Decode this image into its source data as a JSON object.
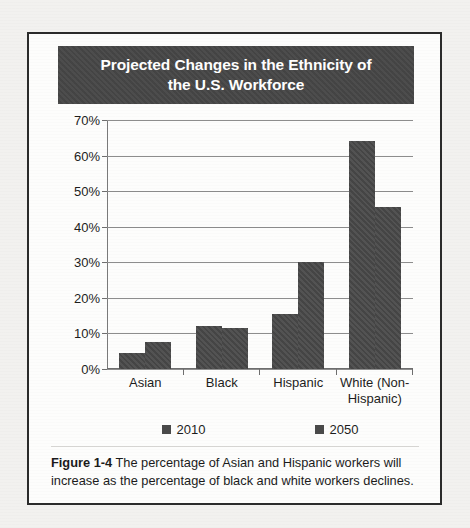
{
  "figure": {
    "title_line1": "Projected Changes in the Ethnicity of",
    "title_line2": "the U.S. Workforce",
    "caption_label": "Figure 1-4",
    "caption_text": "The percentage of Asian and Hispanic workers will increase as the percentage of black and white workers declines.",
    "colors": {
      "bar": "#4a4a4a",
      "title_banner": "#474747",
      "title_text": "#ffffff",
      "border": "#2b2b2b",
      "gridline": "#8d8d8d",
      "page_background": "#f2f1ef",
      "figure_background": "#fdfdfc"
    }
  },
  "chart_data": {
    "type": "bar",
    "title": "Projected Changes in the Ethnicity of the U.S. Workforce",
    "categories": [
      "Asian",
      "Black",
      "Hispanic",
      "White (Non-Hispanic)"
    ],
    "category_labels": [
      [
        "Asian"
      ],
      [
        "Black"
      ],
      [
        "Hispanic"
      ],
      [
        "White (Non-",
        "Hispanic)"
      ]
    ],
    "series": [
      {
        "name": "2010",
        "values": [
          4.5,
          12.0,
          15.5,
          64.0
        ]
      },
      {
        "name": "2050",
        "values": [
          7.5,
          11.5,
          30.0,
          45.5
        ]
      }
    ],
    "xlabel": "",
    "ylabel": "",
    "ylim": [
      0,
      70
    ],
    "ytick_values": [
      70,
      60,
      50,
      40,
      30,
      20,
      10,
      0
    ],
    "ytick_labels": [
      "70%",
      "60%",
      "50%",
      "40%",
      "30%",
      "20%",
      "10%",
      "0%"
    ],
    "grid": true,
    "legend_position": "bottom",
    "value_unit": "percent"
  }
}
